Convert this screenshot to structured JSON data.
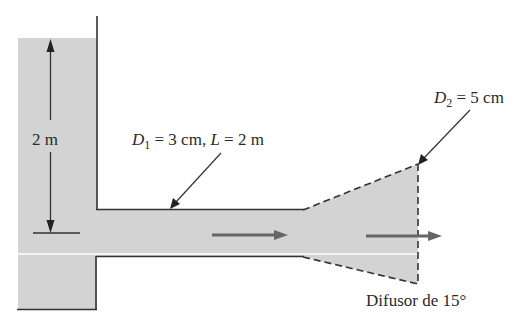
{
  "diagram": {
    "type": "fluid-system-schematic",
    "labels": {
      "height": "2 m",
      "d1_var": "D",
      "d1_sub": "1",
      "d1_rest": " = 3 cm, ",
      "l_var": "L",
      "l_rest": " = 2 m",
      "d2_var": "D",
      "d2_sub": "2",
      "d2_rest": " = 5 cm",
      "diffuser": "Difusor de 15°"
    },
    "components": [
      {
        "name": "tank",
        "water_height": "2 m"
      },
      {
        "name": "pipe",
        "diameter": "3 cm",
        "length": "2 m"
      },
      {
        "name": "diffuser",
        "angle": "15°",
        "outlet_diameter": "5 cm"
      }
    ],
    "flow_direction": "left-to-right",
    "colors": {
      "fluid": "#d3d3d3",
      "line": "#333333",
      "arrow": "#666666"
    }
  }
}
